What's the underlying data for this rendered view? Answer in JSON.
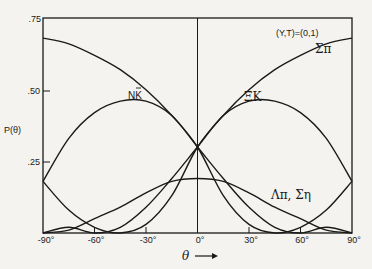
{
  "chart_data": {
    "type": "line",
    "title": "",
    "annotation": "(Y,T)=(0,1)",
    "xlabel": "θ →",
    "ylabel": "P(θ)",
    "xlim": [
      -90,
      90
    ],
    "ylim": [
      0,
      0.75
    ],
    "grid": false,
    "legend_position": "inline labels",
    "x_ticks": [
      "-90°",
      "-60°",
      "-30°",
      "0°",
      "30°",
      "60°",
      "90°"
    ],
    "x_tick_values": [
      -90,
      -60,
      -30,
      0,
      30,
      60,
      90
    ],
    "y_ticks": [
      ".25",
      ".50",
      ".75"
    ],
    "y_tick_values": [
      0.25,
      0.5,
      0.75
    ],
    "x": [
      -90,
      -75,
      -60,
      -45,
      -30,
      -15,
      0,
      15,
      30,
      45,
      60,
      75,
      90
    ],
    "series": [
      {
        "name": "Σπ",
        "label_pos": [
          78,
          0.68
        ],
        "values": [
          0.18,
          0.08,
          0.02,
          0.0,
          0.03,
          0.13,
          0.3,
          0.41,
          0.5,
          0.57,
          0.62,
          0.66,
          0.68
        ]
      },
      {
        "name": "(mirror of Σπ)",
        "label_pos": null,
        "values": [
          0.68,
          0.66,
          0.62,
          0.57,
          0.5,
          0.41,
          0.3,
          0.13,
          0.03,
          0.0,
          0.02,
          0.08,
          0.18
        ]
      },
      {
        "name": "NK̄",
        "label_pos": [
          -40,
          0.49
        ],
        "values": [
          0.18,
          0.33,
          0.42,
          0.46,
          0.46,
          0.41,
          0.3,
          0.19,
          0.09,
          0.02,
          0.0,
          0.02,
          0.0
        ]
      },
      {
        "name": "ΞK",
        "label_pos": [
          33,
          0.49
        ],
        "values": [
          0.0,
          0.02,
          0.0,
          0.02,
          0.09,
          0.19,
          0.3,
          0.41,
          0.46,
          0.46,
          0.42,
          0.33,
          0.18
        ]
      },
      {
        "name": "Λπ, Ση",
        "label_pos": [
          45,
          0.12
        ],
        "values": [
          0.0,
          0.01,
          0.05,
          0.09,
          0.14,
          0.18,
          0.19,
          0.18,
          0.14,
          0.09,
          0.05,
          0.01,
          0.0
        ]
      }
    ]
  },
  "labels": {
    "annotation": "(Y,T)=(0,1)",
    "sigma_pi": "Σπ",
    "nkbar_n": "NK",
    "xi_k": "ΞK",
    "lambda_pi": "Λπ, Ση",
    "ylabel": "P(θ)",
    "xlabel": "θ",
    "arrow": "⟶",
    "y75": ".75",
    "y50": ".50",
    "y25": ".25",
    "xm90": "-90°",
    "xm60": "-60°",
    "xm30": "-30°",
    "x0": "0°",
    "x30": "30°",
    "x60": "60°",
    "x90": "90°"
  }
}
